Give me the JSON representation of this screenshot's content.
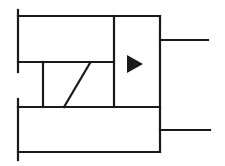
{
  "diagram": {
    "type": "schematic-symbol",
    "stroke_color": "#1a1a1a",
    "background": "#ffffff",
    "arrow_direction": "right",
    "right_leads": 2,
    "left_terminals": 2
  }
}
